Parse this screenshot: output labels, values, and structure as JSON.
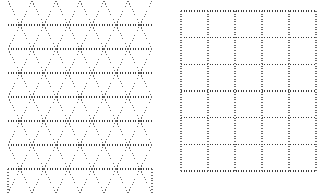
{
  "figure": {
    "background_color": "#ffffff",
    "width": 332,
    "height": 195
  },
  "style": {
    "dot_color": "#6a6a6a",
    "dot_color_dark": "#3c3c3c",
    "dot_color_light": "#aaaaaa",
    "stroke_width": 1.1,
    "dash_pattern": "1 1.6",
    "dash_pattern_diagonal": "1 1.9"
  },
  "panels": [
    {
      "id": "triangular-lattice",
      "name": "Triangular lattice panel",
      "lattice_type": "triangular",
      "bounds": {
        "x": 8,
        "y": 1,
        "width": 144,
        "height": 171
      },
      "rows": 7,
      "columns": 6,
      "row_spacing": 24,
      "column_spacing": 24,
      "half_column": 12,
      "horizontal_line_y": [
        25,
        49,
        73,
        97,
        121,
        145,
        169
      ],
      "vertical_column_x": [
        8,
        32,
        56,
        80,
        104,
        128,
        152
      ],
      "diagonal_angle_degrees": 63.4,
      "top_row_shape": "peaks",
      "bottom_row_shape": "valleys",
      "description": "Isometric triangular grid of dotted lines forming rows of alternating up and down triangles."
    },
    {
      "id": "square-lattice",
      "name": "Square lattice panel",
      "lattice_type": "square",
      "bounds": {
        "x": 181,
        "y": 11,
        "width": 135,
        "height": 160
      },
      "rows": 6,
      "columns": 5,
      "cell_width": 27,
      "cell_height": 26.7,
      "horizontal_line_y": [
        11,
        37.7,
        64.3,
        91,
        117.7,
        144.3,
        171
      ],
      "vertical_line_x": [
        181,
        208,
        235,
        262,
        289,
        316
      ],
      "description": "Regular square grid of dotted lines, 5 cells wide by 6 cells tall."
    }
  ],
  "chart_data": {
    "type": "diagram",
    "panel_count": 2,
    "panels": [
      {
        "label": "triangular lattice",
        "lattice": "triangular",
        "rows": 7,
        "cols": 6,
        "spacing": 24
      },
      {
        "label": "square lattice",
        "lattice": "square",
        "rows": 6,
        "cols": 5,
        "spacing": 27
      }
    ]
  }
}
